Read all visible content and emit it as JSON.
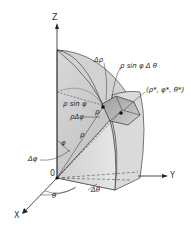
{
  "diagram": {
    "type": "spherical-volume-element",
    "axes": {
      "z": "Z",
      "y": "Y",
      "x": "X",
      "origin": "0"
    },
    "labels": {
      "delta_rho": "Δρ",
      "rho_sin_phi_delta_theta": "ρ sin φ Δ θ",
      "point": "(ρ*, φ*, θ*)",
      "rho_sin_phi": "ρ sin φ",
      "rho_label": "ρ",
      "rho_delta_phi": "ρΔφ",
      "phi": "φ",
      "delta_phi": "Δφ",
      "theta": "θ",
      "delta_theta": "Δθ",
      "rho_ray": "ρ"
    },
    "colors": {
      "surface_light": "#e2e2e2",
      "surface_mid": "#c8c8c8",
      "surface_dark": "#a9a9a9",
      "line": "#333333"
    }
  }
}
